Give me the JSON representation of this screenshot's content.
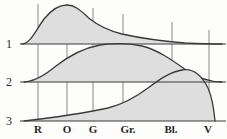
{
  "figure": {
    "background_color": "#fdfdfc",
    "fill_color": "#dedede",
    "stroke_color": "#3a3a3a",
    "grid_color": "#8a8a8a"
  },
  "y_axis": {
    "labels": [
      {
        "text": "1",
        "baseline_y": 44
      },
      {
        "text": "2",
        "baseline_y": 82
      },
      {
        "text": "3",
        "baseline_y": 121
      }
    ]
  },
  "x_axis": {
    "ticks": [
      {
        "label": "R",
        "x": 38
      },
      {
        "label": "O",
        "x": 67
      },
      {
        "label": "G",
        "x": 93
      },
      {
        "label": "Gr.",
        "x": 128
      },
      {
        "label": "Bl.",
        "x": 171
      },
      {
        "label": "V",
        "x": 208
      }
    ]
  },
  "chart_data": {
    "type": "area",
    "xlabel": "",
    "ylabel": "",
    "grid": true,
    "legend": "none",
    "categories": [
      "R",
      "O",
      "G",
      "Gr.",
      "Bl.",
      "V"
    ],
    "x_tick_positions": [
      38,
      67,
      93,
      128,
      171,
      208
    ],
    "baselines": [
      44,
      82,
      121
    ],
    "series": [
      {
        "name": "1",
        "baseline_label": "1",
        "peak_at": "O",
        "description": "Rises steeply from the left edge, peaks just before O, then decays slowly and flattens toward V",
        "values": [
          0.62,
          1.0,
          0.78,
          0.43,
          0.17,
          0.05
        ],
        "path": "M 22,44 C 30,44 36,30 44,19 C 52,9 60,5 67,5 C 76,5 82,12 90,19 C 100,27 110,31 122,34 C 140,38 160,41 185,43 C 198,43.6 210,44 222,44 Z"
      },
      {
        "name": "2",
        "baseline_label": "2",
        "peak_at": "Gr.",
        "description": "Broad symmetric bell centred near Gr., low at both ends",
        "values": [
          0.06,
          0.34,
          0.63,
          0.98,
          0.55,
          0.08
        ],
        "path": "M 24,82 C 34,81.5 44,76 56,66 C 70,55 84,48 100,45 C 114,43 128,43 142,46 C 158,50 172,60 186,70 C 198,78 210,82 222,82 Z"
      },
      {
        "name": "3",
        "baseline_label": "3",
        "peak_at": "Bl.",
        "description": "Creeps up slowly across R to Gr., climbs steeply after Gr., peaks past Bl., then falls sharply to the baseline at V",
        "values": [
          0.03,
          0.07,
          0.12,
          0.24,
          0.82,
          0.55
        ],
        "path": "M 24,121 C 50,118 80,114 108,108 C 124,104 136,97 148,88 C 160,79 170,72 182,70 C 194,68 202,76 208,88 C 212,97 214,110 215,121 Z"
      }
    ]
  }
}
